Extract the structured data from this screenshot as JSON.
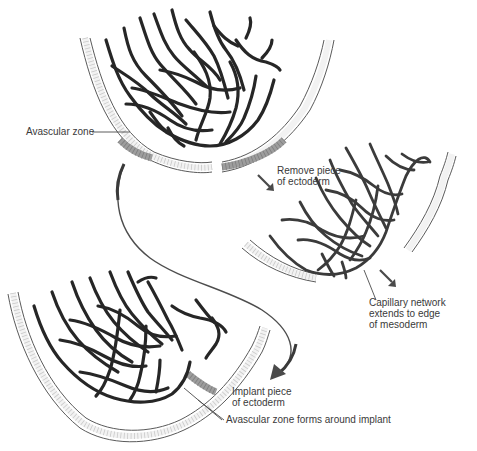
{
  "diagram": {
    "stages": [
      {
        "id": "stage-1",
        "description": "Original embryo with capillary network and avascular zone"
      },
      {
        "id": "stage-2",
        "description": "Piece of ectoderm removed; capillary network extends to edge of mesoderm"
      },
      {
        "id": "stage-3",
        "description": "Ectoderm implanted; avascular zone forms around implant"
      }
    ],
    "labels": {
      "avascular_zone": "Avascular zone",
      "remove_piece": [
        "Remove piece",
        "of ectoderm"
      ],
      "capillary_network": [
        "Capillary network",
        "extends to edge",
        "of mesoderm"
      ],
      "implant_piece": [
        "Implant piece",
        "of ectoderm"
      ],
      "avascular_forms": "Avascular zone forms around implant"
    },
    "colors": {
      "vessel": "#262626",
      "ectoderm_grey": "#9d9d9d",
      "ectoderm_light": "#f2f2f2",
      "text": "#3a3a3a",
      "background": "#ffffff"
    }
  }
}
